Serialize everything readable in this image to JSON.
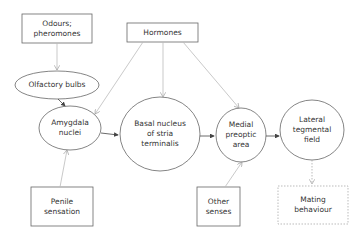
{
  "diagram": {
    "nodes": {
      "odours": {
        "label": "Odours;\npheromones",
        "shape": "box"
      },
      "hormones": {
        "label": "Hormones",
        "shape": "box"
      },
      "olfactory": {
        "label": "Olfactory bulbs",
        "shape": "ellipse"
      },
      "amygdala": {
        "label": "Amygdala\nnuclei",
        "shape": "ellipse"
      },
      "basal": {
        "label": "Basal nucleus\nof stria\nterminalis",
        "shape": "ellipse"
      },
      "medial": {
        "label": "Medial\npreoptic\narea",
        "shape": "ellipse"
      },
      "lateral": {
        "label": "Lateral\ntegmental\nfield",
        "shape": "ellipse"
      },
      "penile": {
        "label": "Penile\nsensation",
        "shape": "box"
      },
      "other": {
        "label": "Other\nsenses",
        "shape": "box"
      },
      "mating": {
        "label": "Mating\nbehaviour",
        "shape": "dotted-box"
      }
    },
    "edges": [
      {
        "from": "odours",
        "to": "olfactory",
        "style": "light"
      },
      {
        "from": "olfactory",
        "to": "amygdala",
        "style": "solid"
      },
      {
        "from": "hormones",
        "to": "amygdala",
        "style": "light"
      },
      {
        "from": "hormones",
        "to": "basal",
        "style": "light"
      },
      {
        "from": "hormones",
        "to": "medial",
        "style": "light"
      },
      {
        "from": "amygdala",
        "to": "basal",
        "style": "solid"
      },
      {
        "from": "basal",
        "to": "medial",
        "style": "solid"
      },
      {
        "from": "medial",
        "to": "lateral",
        "style": "solid"
      },
      {
        "from": "penile",
        "to": "amygdala",
        "style": "light"
      },
      {
        "from": "other",
        "to": "medial",
        "style": "light"
      },
      {
        "from": "lateral",
        "to": "mating",
        "style": "dotted"
      }
    ],
    "colors": {
      "stroke": "#555555",
      "light": "#bbbbbb",
      "text": "#333333"
    }
  }
}
